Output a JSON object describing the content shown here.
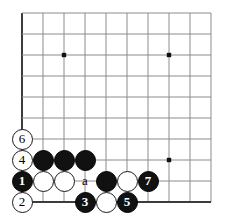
{
  "diagram": {
    "kind": "go-board-diagram",
    "board": {
      "cols": 10,
      "rows": 10,
      "origin_x": 22,
      "origin_y": 13,
      "spacing": 21,
      "line_color": "#8c8c8c",
      "edge_color": "#3c3c3c",
      "background": "#ffffff",
      "stone_radius": 10.5
    },
    "star_points": [
      {
        "col": 3,
        "row": 3
      },
      {
        "col": 8,
        "row": 3
      },
      {
        "col": 8,
        "row": 8
      }
    ],
    "stones": [
      {
        "id": "w6",
        "color": "white",
        "label": "6",
        "col": 1,
        "row": 7
      },
      {
        "id": "w4",
        "color": "white",
        "label": "4",
        "col": 1,
        "row": 8
      },
      {
        "id": "b1",
        "color": "black",
        "label": "1",
        "col": 1,
        "row": 9
      },
      {
        "id": "w2",
        "color": "white",
        "label": "2",
        "col": 1,
        "row": 10
      },
      {
        "id": "b-a1",
        "color": "black",
        "label": "",
        "col": 2,
        "row": 8
      },
      {
        "id": "b-a2",
        "color": "black",
        "label": "",
        "col": 3,
        "row": 8
      },
      {
        "id": "b-a3",
        "color": "black",
        "label": "",
        "col": 4,
        "row": 8
      },
      {
        "id": "w-b1",
        "color": "white",
        "label": "",
        "col": 2,
        "row": 9
      },
      {
        "id": "w-b2",
        "color": "white",
        "label": "",
        "col": 3,
        "row": 9
      },
      {
        "id": "b-c1",
        "color": "black",
        "label": "",
        "col": 5,
        "row": 9
      },
      {
        "id": "w-c1",
        "color": "white",
        "label": "",
        "col": 6,
        "row": 9
      },
      {
        "id": "b7",
        "color": "black",
        "label": "7",
        "col": 7,
        "row": 9
      },
      {
        "id": "b3",
        "color": "black",
        "label": "3",
        "col": 4,
        "row": 10
      },
      {
        "id": "w-d1",
        "color": "white",
        "label": "",
        "col": 5,
        "row": 10
      },
      {
        "id": "b5",
        "color": "black",
        "label": "5",
        "col": 6,
        "row": 10
      }
    ],
    "point_labels": [
      {
        "id": "label-a",
        "text": "a",
        "col": 4,
        "row": 9
      }
    ],
    "move_numbers": [
      "1",
      "2",
      "3",
      "4",
      "5",
      "6",
      "7"
    ],
    "colors": {
      "black_stone": "#111111",
      "white_stone": "#ffffff",
      "stone_outline": "#1a1a1a",
      "grid": "#8c8c8c",
      "border": "#3c3c3c"
    }
  }
}
